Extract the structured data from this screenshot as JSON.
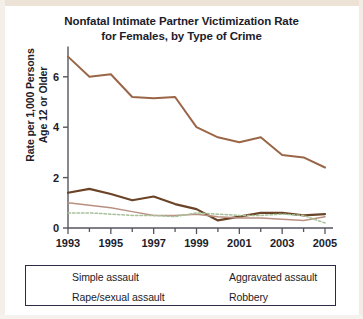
{
  "chart_data": {
    "type": "line",
    "title": "Nonfatal Intimate Partner Victimization Rate for Females, by Type of Crime",
    "title_line1": "Nonfatal Intimate Partner Victimization Rate",
    "title_line2": "for Females, by Type of Crime",
    "xlabel": "",
    "ylabel": "Rate per 1,000 Persons Age 12 or Older",
    "ylabel_line1": "Rate per 1,000 Persons",
    "ylabel_line2": "Age 12 or Older",
    "x": [
      1993,
      1994,
      1995,
      1996,
      1997,
      1998,
      1999,
      2000,
      2001,
      2002,
      2003,
      2004,
      2005
    ],
    "xtick_labels": [
      "1993",
      "1995",
      "1997",
      "1999",
      "2001",
      "2003",
      "2005"
    ],
    "xticks": [
      1993,
      1995,
      1997,
      1999,
      2001,
      2003,
      2005
    ],
    "ytick_labels": [
      "0",
      "2",
      "4",
      "6"
    ],
    "yticks": [
      0,
      2,
      4,
      6
    ],
    "xlim": [
      1993,
      2005
    ],
    "ylim": [
      0,
      7.2
    ],
    "grid": false,
    "legend_position": "below",
    "series": [
      {
        "name": "Simple assault",
        "color": "#9a6647",
        "style": "solid",
        "values": [
          6.8,
          6.0,
          6.1,
          5.2,
          5.15,
          5.2,
          4.0,
          3.6,
          3.4,
          3.6,
          2.9,
          2.8,
          2.4
        ]
      },
      {
        "name": "Aggravated assault",
        "color": "#6b4326",
        "style": "solid",
        "values": [
          1.4,
          1.55,
          1.35,
          1.1,
          1.25,
          0.95,
          0.75,
          0.3,
          0.45,
          0.6,
          0.6,
          0.5,
          0.55
        ]
      },
      {
        "name": "Rape/sexual assault",
        "color": "#b98f80",
        "style": "solid",
        "values": [
          1.0,
          0.9,
          0.8,
          0.65,
          0.5,
          0.5,
          0.55,
          0.45,
          0.4,
          0.4,
          0.35,
          0.3,
          0.45
        ]
      },
      {
        "name": "Robbery",
        "color": "#a8c19a",
        "style": "dotted",
        "values": [
          0.6,
          0.6,
          0.55,
          0.5,
          0.5,
          0.45,
          0.6,
          0.55,
          0.5,
          0.5,
          0.55,
          0.5,
          0.2
        ]
      }
    ]
  },
  "legend": {
    "items": [
      {
        "label": "Simple assault"
      },
      {
        "label": "Aggravated assault"
      },
      {
        "label": "Rape/sexual assault"
      },
      {
        "label": "Robbery"
      }
    ]
  }
}
